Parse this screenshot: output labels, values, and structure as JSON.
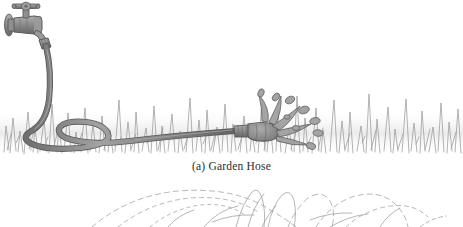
{
  "figure": {
    "title": "(a) Garden Hose",
    "caption": "(a) Garden Hose",
    "part_label": "(a)",
    "subject": "Garden Hose",
    "style": "grayscale line illustration",
    "background_color": "#ffffff"
  },
  "palette": {
    "outline": "#5a5a5a",
    "hose_fill": "#8a8a8a",
    "hose_shadow": "#6e6e6e",
    "hose_highlight": "#a8a8a8",
    "faucet_fill": "#8f8f8f",
    "faucet_dark": "#6a6a6a",
    "grass_stroke": "#9a9a9a",
    "grass_haze": "#e3e3e3",
    "spray_stroke": "#9e9e9e",
    "caption_text": "#2b2b2b",
    "page_white": "#ffffff"
  },
  "elements": {
    "faucet_label": "wall spigot with cross handle",
    "hose_label": "coiled garden hose",
    "coupling_label": "hose coupling",
    "sprinkler_label": "sprinkler nozzle",
    "water_label": "water droplets spray",
    "grass_label": "grass lawn band",
    "next_figure_label": "spray arcs of next figure"
  },
  "geometry": {
    "grass_top_y": 85,
    "grass_bottom_y": 160,
    "caption_y": 160,
    "next_figure_top_y": 185,
    "canvas_width": 463,
    "canvas_height": 227
  }
}
